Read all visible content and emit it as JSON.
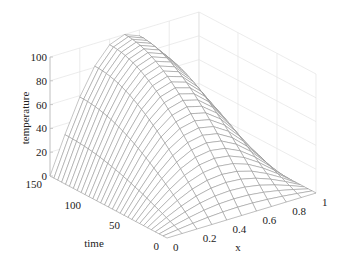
{
  "chart_data": {
    "type": "surface_mesh",
    "title": "",
    "xlabel": "x",
    "ylabel": "time",
    "zlabel": "temperature",
    "x_range": [
      0,
      1
    ],
    "time_range": [
      0,
      150
    ],
    "z_range": [
      0,
      100
    ],
    "x_ticks": [
      "0",
      "0.2",
      "0.4",
      "0.6",
      "0.8",
      "1"
    ],
    "time_ticks": [
      "0",
      "50",
      "100",
      "150"
    ],
    "z_ticks": [
      "0",
      "20",
      "40",
      "60",
      "80",
      "100"
    ],
    "x_tick_values": [
      0,
      0.2,
      0.4,
      0.6,
      0.8,
      1
    ],
    "time_tick_values": [
      0,
      50,
      100,
      150
    ],
    "z_tick_values": [
      0,
      20,
      40,
      60,
      80,
      100
    ],
    "grid": true,
    "surface_description": "temperature(x,t) = 0 at x=0, x=1 and t=0; rises with time to ~100 peak near x=0.5, t=150; sine-shaped profile in x",
    "mesh_x_points": 11,
    "mesh_time_points": 31,
    "peak_value": 100,
    "mesh_color": "#8a8a8a",
    "grid_color": "#e4e4e4"
  },
  "axes": {
    "x_label": "x",
    "time_label": "time",
    "z_label": "temperature"
  }
}
